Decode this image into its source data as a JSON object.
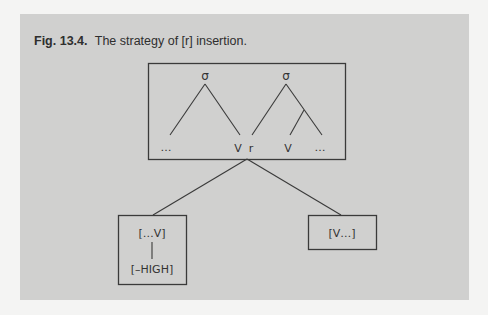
{
  "caption": {
    "label": "Fig. 13.4.",
    "text": "The strategy of [r] insertion."
  },
  "diagram": {
    "top_box": {
      "syllables": [
        {
          "node": "σ",
          "left_leaf": "…",
          "right_leaf": "V"
        },
        {
          "node": "σ",
          "left_leaf": "r",
          "sub_left_leaf": "V",
          "sub_right_leaf": "…"
        }
      ]
    },
    "left_box": {
      "segment": "[…V]",
      "feature": "[–HIGH]"
    },
    "right_box": {
      "segment": "[V…]"
    }
  },
  "colors": {
    "panel": "#d0d0cf",
    "line": "#3a3a3a",
    "text": "#333333"
  }
}
